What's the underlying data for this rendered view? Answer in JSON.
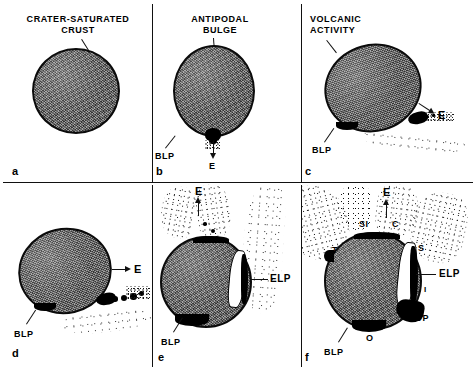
{
  "figure": {
    "background_color": "#ffffff",
    "ink_color": "#111111",
    "body_fill_color": "#6e6e6e"
  },
  "panels": [
    {
      "letter": "a",
      "heading": "CRATER-SATURATED\nCRUST",
      "labels": []
    },
    {
      "letter": "b",
      "heading": "ANTIPODAL\nBULGE",
      "labels": [
        "BLP",
        "E"
      ]
    },
    {
      "letter": "c",
      "heading": "VOLCANIC\nACTIVITY",
      "labels": [
        "E",
        "BLP"
      ]
    },
    {
      "letter": "d",
      "heading": "",
      "labels": [
        "E",
        "BLP"
      ]
    },
    {
      "letter": "e",
      "heading": "",
      "labels": [
        "E",
        "ELP",
        "BLP"
      ]
    },
    {
      "letter": "f",
      "heading": "",
      "labels": [
        "E",
        "SI",
        "C",
        "S",
        "T",
        "ELP",
        "I",
        "OP",
        "O",
        "BLP"
      ]
    }
  ],
  "label_text": {
    "crater_saturated_crust": "CRATER-SATURATED\nCRUST",
    "antipodal_bulge": "ANTIPODAL\nBULGE",
    "volcanic_activity": "VOLCANIC\nACTIVITY",
    "blp": "BLP",
    "elp": "ELP",
    "e": "E",
    "si": "SI",
    "c": "C",
    "s": "S",
    "t": "T",
    "i": "I",
    "op": "OP",
    "o": "O"
  },
  "panel_letters": {
    "a": "a",
    "b": "b",
    "c": "c",
    "d": "d",
    "e": "e",
    "f": "f"
  }
}
